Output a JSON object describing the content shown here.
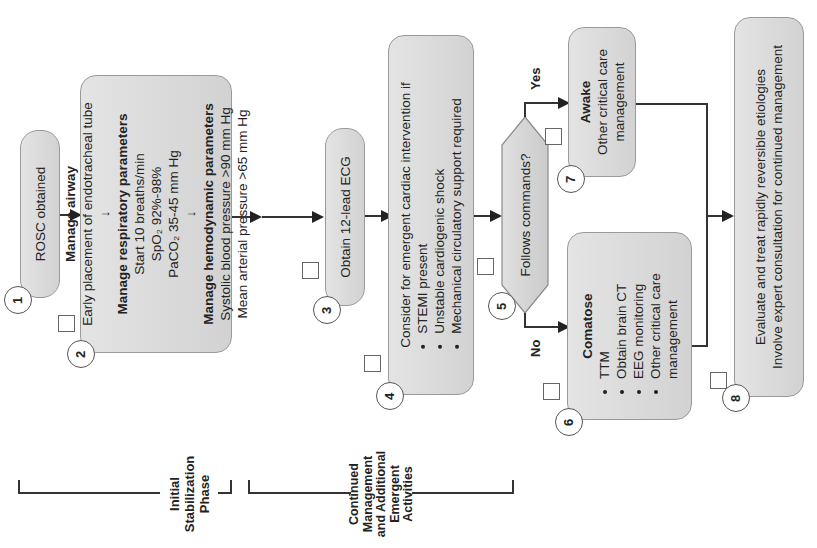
{
  "diagram": {
    "orientation": "rotated-90-ccw",
    "steps": [
      {
        "number": "1",
        "title": "",
        "lines": [
          "ROSC obtained"
        ]
      },
      {
        "number": "2",
        "sections": [
          {
            "title": "Manage airway",
            "lines": [
              "Early placement of endotracheal tube"
            ]
          },
          {
            "title": "Manage respiratory parameters",
            "lines": [
              "Start 10 breaths/min",
              "SpO₂ 92%-98%",
              "PaCO₂ 35-45 mm Hg"
            ]
          },
          {
            "title": "Manage hemodynamic parameters",
            "lines": [
              "Systolic blood pressure >90 mm Hg",
              "Mean arterial pressure >65 mm Hg"
            ]
          }
        ]
      },
      {
        "number": "3",
        "lines": [
          "Obtain 12-lead ECG"
        ]
      },
      {
        "number": "4",
        "intro": "Consider for emergent cardiac intervention if",
        "bullets": [
          "STEMI present",
          "Unstable cardiogenic shock",
          "Mechanical circulatory support required"
        ]
      },
      {
        "number": "5",
        "question": "Follows commands?",
        "yes_label": "Yes",
        "no_label": "No"
      },
      {
        "number": "6",
        "title": "Comatose",
        "bullets": [
          "TTM",
          "Obtain brain CT",
          "EEG monitoring",
          "Other critical care management"
        ]
      },
      {
        "number": "7",
        "title": "Awake",
        "lines": [
          "Other critical care",
          "management"
        ]
      },
      {
        "number": "8",
        "lines": [
          "Evaluate and treat rapidly reversible etiologies",
          "Involve expert consultation for continued management"
        ]
      }
    ],
    "phases": [
      {
        "label_lines": [
          "Initial",
          "Stabilization",
          "Phase"
        ]
      },
      {
        "label_lines": [
          "Continued",
          "Management",
          "and Additional",
          "Emergent",
          "Activities"
        ]
      }
    ],
    "colors": {
      "box_fill": "#d9d9d9",
      "box_border": "#9a9a9a",
      "line": "#333333",
      "background": "#ffffff"
    }
  }
}
